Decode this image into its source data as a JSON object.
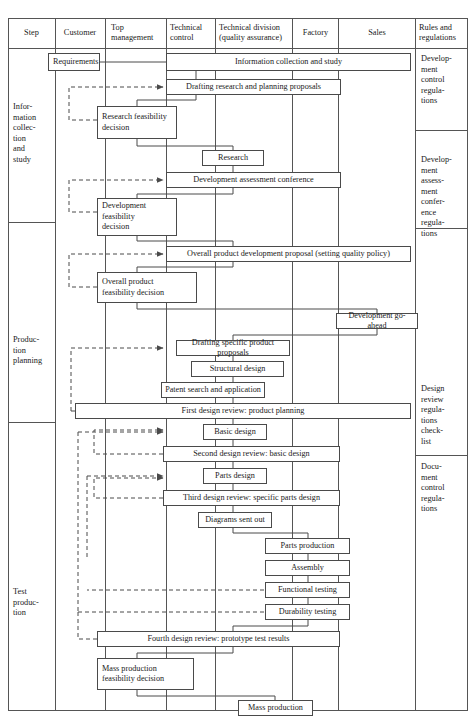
{
  "table": {
    "columns": [
      {
        "id": "step",
        "label": "Step"
      },
      {
        "id": "customer",
        "label": "Customer"
      },
      {
        "id": "top_management",
        "label": "Top\nmanagement"
      },
      {
        "id": "technical_control",
        "label": "Technical\ncontrol"
      },
      {
        "id": "technical_division",
        "label": "Technical division\n(quality assurance)"
      },
      {
        "id": "factory",
        "label": "Factory"
      },
      {
        "id": "sales",
        "label": "Sales"
      },
      {
        "id": "rules",
        "label": "Rules and\nregulations"
      }
    ]
  },
  "steps": [
    {
      "id": "step-information-collection",
      "label": "Infor-\nmation\ncollec-\ntion\nand\nstudy"
    },
    {
      "id": "step-production-planning",
      "label": "Produc-\ntion\nplanning"
    },
    {
      "id": "step-test-production",
      "label": "Test\nproduc-\ntion"
    }
  ],
  "rules": [
    {
      "id": "rule-development-control",
      "label": "Develop-\nment\ncontrol\nregula-\ntions"
    },
    {
      "id": "rule-development-assessment",
      "label": "Develop-\nment\nassess-\nment\nconfer-\nence\nregula-\ntions"
    },
    {
      "id": "rule-design-review",
      "label": "Design\nreview\nregula-\ntions\ncheck-\nlist"
    },
    {
      "id": "rule-document-control",
      "label": "Docu-\nment\ncontrol\nregula-\ntions"
    }
  ],
  "nodes": [
    {
      "id": "requirements",
      "label": "Requirements"
    },
    {
      "id": "information-collection-and-study",
      "label": "Information collection and study"
    },
    {
      "id": "drafting-research-and-planning-proposals",
      "label": "Drafting research and planning proposals"
    },
    {
      "id": "research-feasibility-decision",
      "label": "Research feasibility\ndecision"
    },
    {
      "id": "research",
      "label": "Research"
    },
    {
      "id": "development-assessment-conference",
      "label": "Development assessment conference"
    },
    {
      "id": "development-feasibility-decision",
      "label": "Development\nfeasibility\ndecision"
    },
    {
      "id": "overall-product-development-proposal",
      "label": "Overall product development proposal (setting quality policy)"
    },
    {
      "id": "overall-product-feasibility-decision",
      "label": "Overall product\nfeasibility decision"
    },
    {
      "id": "development-go-ahead",
      "label": "Development go-ahead"
    },
    {
      "id": "drafting-specific-product-proposals",
      "label": "Drafting specific product proposals"
    },
    {
      "id": "structural-design",
      "label": "Structural design"
    },
    {
      "id": "patent-search-and-application",
      "label": "Patent search and application"
    },
    {
      "id": "first-design-review",
      "label": "First design review: product planning"
    },
    {
      "id": "basic-design",
      "label": "Basic design"
    },
    {
      "id": "second-design-review",
      "label": "Second design review: basic design"
    },
    {
      "id": "parts-design",
      "label": "Parts design"
    },
    {
      "id": "third-design-review",
      "label": "Third design review: specific parts design"
    },
    {
      "id": "diagrams-sent-out",
      "label": "Diagrams sent out"
    },
    {
      "id": "parts-production",
      "label": "Parts production"
    },
    {
      "id": "assembly",
      "label": "Assembly"
    },
    {
      "id": "functional-testing",
      "label": "Functional testing"
    },
    {
      "id": "durability-testing",
      "label": "Durability testing"
    },
    {
      "id": "fourth-design-review",
      "label": "Fourth design review: prototype test results"
    },
    {
      "id": "mass-production-feasibility-decision",
      "label": "Mass production\nfeasibility decision"
    },
    {
      "id": "mass-production",
      "label": "Mass production"
    }
  ],
  "colors": {
    "line": "#4a4a4a",
    "frame": "#555555",
    "text": "#1a1a1a",
    "background": "#ffffff"
  }
}
